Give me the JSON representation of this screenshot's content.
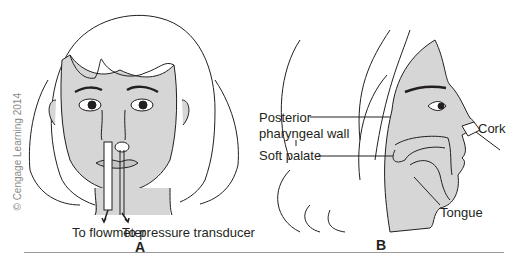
{
  "figure": {
    "copyright": "© Cengage Learning 2014",
    "skin_color": "#d6d6d6",
    "line_color": "#231f20",
    "panel_a": {
      "label": "A",
      "annotations": {
        "flowmeter": "To flowmeter",
        "pressure": "To pressure transducer"
      }
    },
    "panel_b": {
      "label": "B",
      "annotations": {
        "posterior_line1": "Posterior",
        "posterior_line2": "pharyngeal wall",
        "soft_palate": "Soft palate",
        "cork": "Cork",
        "tongue": "Tongue"
      }
    }
  }
}
